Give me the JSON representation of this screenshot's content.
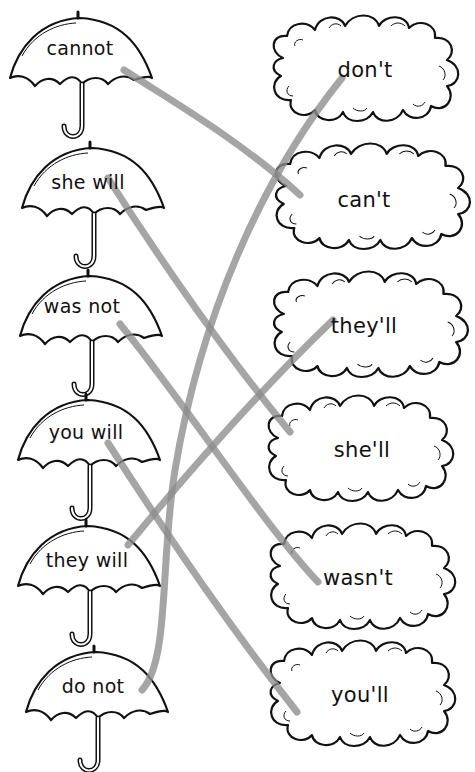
{
  "worksheet": {
    "type": "contraction matching",
    "umbrellas": [
      {
        "label": "cannot",
        "cx": 80,
        "cy": 48,
        "top": 18
      },
      {
        "label": "she will",
        "cx": 88,
        "cy": 182,
        "top": 148
      },
      {
        "label": "was not",
        "cx": 82,
        "cy": 305,
        "top": 276
      },
      {
        "label": "you will",
        "cx": 86,
        "cy": 432,
        "top": 400
      },
      {
        "label": "they will",
        "cx": 87,
        "cy": 560,
        "top": 526
      },
      {
        "label": "do not",
        "cx": 93,
        "cy": 685,
        "top": 652
      }
    ],
    "clouds": [
      {
        "label": "don't",
        "cx": 365,
        "cy": 70
      },
      {
        "label": "can't",
        "cx": 372,
        "cy": 200
      },
      {
        "label": "they'll",
        "cx": 368,
        "cy": 326
      },
      {
        "label": "she'll",
        "cx": 360,
        "cy": 450
      },
      {
        "label": "wasn't",
        "cx": 362,
        "cy": 578
      },
      {
        "label": "you'll",
        "cx": 362,
        "cy": 695
      }
    ],
    "matches": [
      {
        "from": "cannot",
        "to": "can't"
      },
      {
        "from": "she will",
        "to": "she'll"
      },
      {
        "from": "was not",
        "to": "wasn't"
      },
      {
        "from": "you will",
        "to": "you'll"
      },
      {
        "from": "they will",
        "to": "they'll"
      },
      {
        "from": "do not",
        "to": "don't"
      }
    ],
    "colors": {
      "ink": "#111111",
      "pencil": "#9a9a9a",
      "background": "#ffffff"
    }
  }
}
